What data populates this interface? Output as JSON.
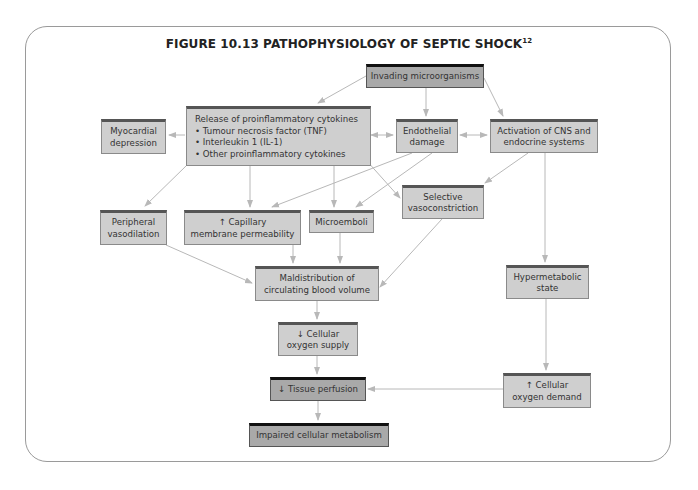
{
  "figure": {
    "title": "FIGURE 10.13 PATHOPHYSIOLOGY OF SEPTIC SHOCK",
    "title_superscript": "12"
  },
  "nodes": {
    "invading": "Invading microorganisms",
    "release": "Release of proinflammatory cytokines\n• Tumour necrosis factor (TNF)\n• Interleukin 1 (IL-1)\n• Other proinflammatory cytokines",
    "myocardial": "Myocardial\ndepression",
    "endothelial": "Endothelial\ndamage",
    "activation": "Activation of CNS and\nendocrine systems",
    "selective": "Selective\nvasoconstriction",
    "peripheral": "Peripheral\nvasodilation",
    "capillary": "↑ Capillary\nmembrane permeability",
    "microemboli": "Microemboli",
    "maldistribution": "Maldistribution of\ncirculating blood volume",
    "hypermetabolic": "Hypermetabolic\nstate",
    "oxygen_supply": "↓ Cellular\noxygen supply",
    "oxygen_demand": "↑ Cellular\noxygen demand",
    "tissue_perfusion": "↓ Tissue perfusion",
    "impaired": "Impaired cellular metabolism"
  },
  "edges": [
    [
      "invading",
      "release"
    ],
    [
      "invading",
      "endothelial"
    ],
    [
      "invading",
      "activation"
    ],
    [
      "release",
      "myocardial"
    ],
    [
      "release",
      "endothelial",
      "bidirectional"
    ],
    [
      "endothelial",
      "activation",
      "bidirectional"
    ],
    [
      "release",
      "peripheral"
    ],
    [
      "release",
      "capillary"
    ],
    [
      "release",
      "microemboli"
    ],
    [
      "release",
      "selective"
    ],
    [
      "endothelial",
      "capillary"
    ],
    [
      "endothelial",
      "microemboli"
    ],
    [
      "activation",
      "selective"
    ],
    [
      "activation",
      "hypermetabolic"
    ],
    [
      "peripheral",
      "maldistribution"
    ],
    [
      "capillary",
      "maldistribution"
    ],
    [
      "microemboli",
      "maldistribution"
    ],
    [
      "selective",
      "maldistribution"
    ],
    [
      "maldistribution",
      "oxygen_supply"
    ],
    [
      "oxygen_supply",
      "tissue_perfusion"
    ],
    [
      "hypermetabolic",
      "oxygen_demand"
    ],
    [
      "oxygen_demand",
      "tissue_perfusion"
    ],
    [
      "tissue_perfusion",
      "impaired"
    ]
  ],
  "colors": {
    "box_fill": "#cfcfcf",
    "box_fill_emphasis": "#a9a9a9",
    "arrow": "#b8b8b8",
    "frame": "#9a9a9a"
  }
}
